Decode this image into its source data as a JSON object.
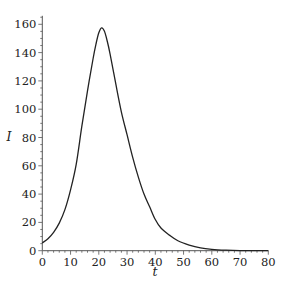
{
  "chart_data": {
    "type": "line",
    "title": "",
    "xlabel": "t",
    "ylabel": "I",
    "xlim": [
      0,
      80
    ],
    "ylim": [
      0,
      165
    ],
    "grid": false,
    "legend": null,
    "x_ticks": [
      0,
      10,
      20,
      30,
      40,
      50,
      60,
      70,
      80
    ],
    "y_ticks": [
      0,
      20,
      40,
      60,
      80,
      100,
      120,
      140,
      160
    ],
    "series": [
      {
        "name": "I(t)",
        "color": "#222222",
        "x": [
          0,
          2,
          4,
          6,
          8,
          10,
          12,
          14,
          16,
          18,
          19,
          20,
          21,
          22,
          23,
          24,
          26,
          28,
          30,
          32,
          34,
          36,
          38,
          40,
          42,
          45,
          48,
          52,
          56,
          60,
          65,
          70,
          80
        ],
        "y": [
          5.5,
          8.5,
          13,
          19.5,
          29,
          43,
          61,
          88,
          113,
          136,
          146,
          154,
          157.5,
          155,
          148,
          139,
          118,
          98,
          82,
          66,
          52,
          40,
          31,
          22,
          16,
          11,
          7,
          4,
          2,
          1,
          0.4,
          0.1,
          0
        ]
      }
    ]
  },
  "axes": {
    "x_label": "t",
    "y_label": "I",
    "x_tick_labels": [
      "0",
      "10",
      "20",
      "30",
      "40",
      "50",
      "60",
      "70",
      "80"
    ],
    "y_tick_labels": [
      "0",
      "20",
      "40",
      "60",
      "80",
      "100",
      "120",
      "140",
      "160"
    ]
  }
}
